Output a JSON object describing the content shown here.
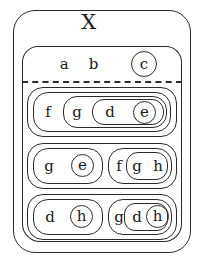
{
  "diagram": {
    "type": "set-nesting-diagram",
    "universe_label": "X",
    "divider": "dashed",
    "stroke_color": "#2b2b2b",
    "background_color": "#ffffff",
    "top_region": {
      "description": "elements of X above the dashed line",
      "items": [
        {
          "label": "a",
          "shape": "plain"
        },
        {
          "label": "b",
          "shape": "plain"
        },
        {
          "label": "c",
          "shape": "circle"
        }
      ]
    },
    "rows": [
      {
        "name": "row-1",
        "groups": [
          {
            "name": "group-1",
            "plain": [
              {
                "label": "f"
              }
            ],
            "nested": {
              "plain": [
                {
                  "label": "g"
                }
              ],
              "nested": {
                "plain": [
                  {
                    "label": "d"
                  }
                ],
                "circled": [
                  {
                    "label": "e"
                  }
                ]
              }
            }
          }
        ]
      },
      {
        "name": "row-2",
        "groups": [
          {
            "name": "group-2-left",
            "plain": [
              {
                "label": "g"
              }
            ],
            "circled": [
              {
                "label": "e"
              }
            ]
          },
          {
            "name": "group-2-right",
            "plain": [
              {
                "label": "f"
              }
            ],
            "nested": {
              "plain": [
                {
                  "label": "g"
                },
                {
                  "label": "h"
                }
              ]
            }
          }
        ]
      },
      {
        "name": "row-3",
        "groups": [
          {
            "name": "group-3-left",
            "plain": [
              {
                "label": "d"
              }
            ],
            "circled": [
              {
                "label": "h"
              }
            ]
          },
          {
            "name": "group-3-right",
            "plain": [
              {
                "label": "g"
              }
            ],
            "nested": {
              "plain": [
                {
                  "label": "d"
                }
              ],
              "circled": [
                {
                  "label": "h"
                }
              ]
            }
          }
        ]
      }
    ]
  }
}
